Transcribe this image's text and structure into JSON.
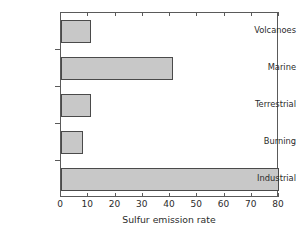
{
  "chart_data": {
    "type": "bar",
    "orientation": "horizontal",
    "title": "",
    "xlabel": "Sulfur emission rate",
    "ylabel": "",
    "categories": [
      "Volcanoes",
      "Marine",
      "Terrestrial",
      "Burning",
      "Industrial"
    ],
    "values": [
      11,
      41,
      11,
      8,
      80
    ],
    "xlim": [
      0,
      80
    ],
    "xticks": [
      0,
      10,
      20,
      30,
      40,
      50,
      60,
      70,
      80
    ],
    "xtick_labels": [
      "0",
      "10",
      "20",
      "30",
      "40",
      "50",
      "60",
      "70",
      "80"
    ],
    "grid": false,
    "legend": false,
    "bar_color": "#c8c8c8",
    "bar_edge_color": "#4a4a4a",
    "axis_color": "#5a5a5a",
    "background_color": "#ffffff",
    "series": [
      {
        "name": "Sulfur emission rate",
        "values": [
          11,
          41,
          11,
          8,
          80
        ]
      }
    ]
  },
  "caption": {
    "partial_text": ""
  }
}
